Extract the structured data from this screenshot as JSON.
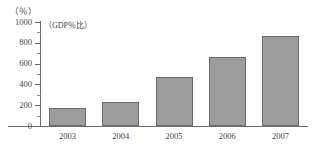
{
  "chart_data": {
    "type": "bar",
    "title": "",
    "subtitle": "",
    "xlabel": "",
    "ylabel": "(%)",
    "unit_label": "（％）",
    "annotation": "（GDP％比）",
    "categories": [
      "2003",
      "2004",
      "2005",
      "2006",
      "2007"
    ],
    "values": [
      175,
      235,
      470,
      660,
      870
    ],
    "series": [
      {
        "name": "GDP比",
        "values": [
          175,
          235,
          470,
          660,
          870
        ]
      }
    ],
    "ylim": [
      0,
      1000
    ],
    "ytick_labels": [
      "1000",
      "800",
      "600",
      "400",
      "200",
      "0"
    ],
    "ytick_values": [
      1000,
      800,
      600,
      400,
      200,
      0
    ],
    "yminor_values": [
      900,
      700,
      500,
      300,
      100
    ],
    "grid": false,
    "legend": false,
    "legend_position": "none",
    "bar_color": "#9d9d9d",
    "bar_border_color": "#6a6a6a",
    "axis_color": "#6d6d6d",
    "text_color": "#3f3f3f",
    "background_color": "#ffffff"
  }
}
